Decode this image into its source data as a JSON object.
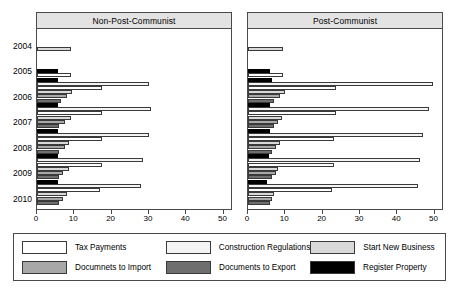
{
  "chart_data": {
    "type": "bar",
    "orientation": "horizontal",
    "title": "",
    "xlabel": "",
    "ylabel": "",
    "xlim": [
      0,
      52
    ],
    "xticks": [
      0,
      10,
      20,
      30,
      40,
      50
    ],
    "xticklabels": [
      "0",
      "10",
      "20",
      "30",
      "40",
      "50"
    ],
    "grid": false,
    "legend_position": "bottom",
    "categories": [
      "2004",
      "2005",
      "2006",
      "2007",
      "2008",
      "2009",
      "2010"
    ],
    "series_order": [
      "Register Property",
      "Start New Business",
      "Construction Regulations",
      "Documnets to Import",
      "Documents to Export",
      "Tax Payments"
    ],
    "panels": [
      {
        "name": "Non-Post-Communist",
        "series": [
          {
            "name": "Tax Payments",
            "key": "tax",
            "color": "#ffffff",
            "values": [
              0,
              9.0,
              17.5,
              17.5,
              17.5,
              17.5,
              17.0
            ]
          },
          {
            "name": "Construction Regulations",
            "key": "cons",
            "color": "#f4f4f4",
            "values": [
              0,
              0,
              30.0,
              30.5,
              30.0,
              28.5,
              28.0
            ]
          },
          {
            "name": "Start New Business",
            "key": "start",
            "color": "#d9d9d9",
            "values": [
              9.0,
              0,
              9.5,
              9.0,
              8.5,
              8.5,
              8.0
            ]
          },
          {
            "name": "Documnets to Import",
            "key": "imp",
            "color": "#a8a8a8",
            "values": [
              0,
              0,
              8.0,
              7.5,
              7.5,
              7.0,
              7.0
            ]
          },
          {
            "name": "Documents to Export",
            "key": "exp",
            "color": "#6e6e6e",
            "values": [
              0,
              0,
              6.5,
              6.0,
              6.0,
              6.0,
              6.0
            ]
          },
          {
            "name": "Register Property",
            "key": "reg",
            "color": "#000000",
            "values": [
              0,
              5.5,
              5.5,
              5.5,
              5.5,
              5.5,
              5.5
            ]
          }
        ]
      },
      {
        "name": "Post-Communist",
        "series": [
          {
            "name": "Tax Payments",
            "key": "tax",
            "color": "#ffffff",
            "values": [
              0,
              9.5,
              23.5,
              23.5,
              23.0,
              23.0,
              22.5
            ]
          },
          {
            "name": "Construction Regulations",
            "key": "cons",
            "color": "#f4f4f4",
            "values": [
              0,
              0,
              49.5,
              48.5,
              47.0,
              46.0,
              45.5
            ]
          },
          {
            "name": "Start New Business",
            "key": "start",
            "color": "#d9d9d9",
            "values": [
              9.5,
              0,
              10.0,
              9.0,
              8.5,
              8.0,
              7.0
            ]
          },
          {
            "name": "Documnets to Import",
            "key": "imp",
            "color": "#a8a8a8",
            "values": [
              0,
              0,
              8.5,
              8.0,
              7.5,
              7.5,
              6.5
            ]
          },
          {
            "name": "Documents to Export",
            "key": "exp",
            "color": "#6e6e6e",
            "values": [
              0,
              0,
              7.0,
              7.0,
              6.5,
              6.5,
              6.0
            ]
          },
          {
            "name": "Register Property",
            "key": "reg",
            "color": "#000000",
            "values": [
              0,
              6.0,
              6.5,
              6.0,
              6.0,
              5.5,
              5.0
            ]
          }
        ]
      }
    ]
  },
  "panels": {
    "left_title": "Non-Post-Communist",
    "right_title": "Post-Communist"
  },
  "axis": {
    "ticklabels": [
      "0",
      "10",
      "20",
      "30",
      "40",
      "50"
    ],
    "years": [
      "2004",
      "2005",
      "2006",
      "2007",
      "2008",
      "2009",
      "2010"
    ]
  },
  "legend": {
    "items": [
      {
        "label": "Tax Payments",
        "color": "#ffffff"
      },
      {
        "label": "Construction Regulations",
        "color": "#f4f4f4"
      },
      {
        "label": "Start New Business",
        "color": "#d9d9d9"
      },
      {
        "label": "Documnets to Import",
        "color": "#a8a8a8"
      },
      {
        "label": "Documents to Export",
        "color": "#6e6e6e"
      },
      {
        "label": "Register Property",
        "color": "#000000"
      }
    ]
  }
}
